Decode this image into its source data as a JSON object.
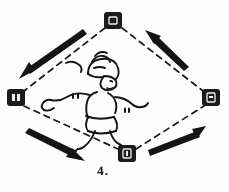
{
  "figure": {
    "caption": "4.",
    "background_color": "#fdfdfd",
    "ink_color": "#141414"
  },
  "nodes": [
    {
      "id": "top",
      "label": "□",
      "x": 113,
      "y": 21,
      "position": "top"
    },
    {
      "id": "left",
      "label": "□",
      "x": 16,
      "y": 98,
      "position": "left"
    },
    {
      "id": "right",
      "label": "□",
      "x": 211,
      "y": 98,
      "position": "right"
    },
    {
      "id": "bottom",
      "label": "□",
      "x": 127,
      "y": 154,
      "position": "bottom"
    }
  ],
  "connections": [
    {
      "from": "top",
      "to": "left",
      "style": "dashed"
    },
    {
      "from": "top",
      "to": "right",
      "style": "dashed"
    },
    {
      "from": "left",
      "to": "bottom",
      "style": "dashed"
    },
    {
      "from": "bottom",
      "to": "right",
      "style": "dashed"
    }
  ],
  "arrows": [
    {
      "id": "arrow-upper-left",
      "direction": "down-left",
      "tail_x": 82,
      "tail_y": 31,
      "head_x": 20,
      "head_y": 72
    },
    {
      "id": "arrow-upper-right",
      "direction": "up-left",
      "tail_x": 185,
      "tail_y": 66,
      "head_x": 146,
      "head_y": 31
    },
    {
      "id": "arrow-lower-left",
      "direction": "down-right",
      "tail_x": 30,
      "tail_y": 132,
      "head_x": 72,
      "head_y": 157
    },
    {
      "id": "arrow-lower-right",
      "direction": "up-right",
      "tail_x": 150,
      "tail_y": 157,
      "head_x": 200,
      "head_y": 128
    }
  ],
  "center_figure": {
    "name": "running-girl",
    "description": "cartoon girl running"
  }
}
